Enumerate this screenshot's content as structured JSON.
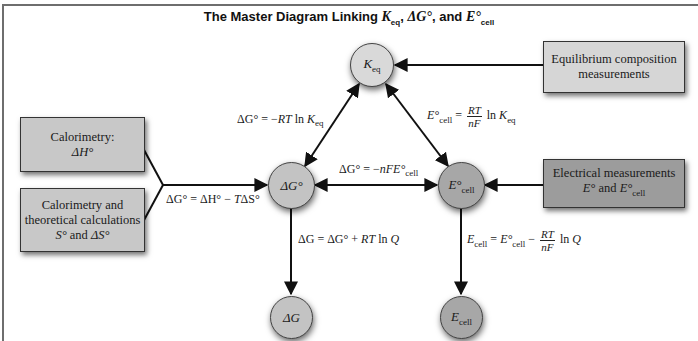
{
  "title": {
    "prefix": "The Master Diagram Linking ",
    "k_symbol": "K",
    "k_sub": "eq",
    "sep1": ", ",
    "dg_symbol": "ΔG°",
    "sep2": ", and ",
    "e_symbol": "E°",
    "e_sub": "cell"
  },
  "nodes": {
    "keq": {
      "symbol": "K",
      "sub": "eq",
      "color": "#d9d9d9"
    },
    "dg0": {
      "symbol": "ΔG°",
      "color": "#c3c3c3"
    },
    "ecell0": {
      "symbol": "E°",
      "sub": "cell",
      "color": "#a7a7a7"
    },
    "dg": {
      "symbol": "ΔG",
      "color": "#c3c3c3"
    },
    "ecell": {
      "symbol": "E",
      "sub": "cell",
      "color": "#a7a7a7"
    }
  },
  "boxes": {
    "equilibrium": {
      "line1": "Equilibrium composition",
      "line2": "measurements",
      "color": "#d6d6d6"
    },
    "electrical": {
      "line1": "Electrical measurements",
      "line2_a": "E°",
      "line2_b": " and ",
      "line2_c": "E°",
      "line2_sub": "cell",
      "color": "#9c9c9c"
    },
    "calorimetry": {
      "line1": "Calorimetry:",
      "line2": "ΔH°",
      "color": "#c8c8c8"
    },
    "theoretical": {
      "line1": "Calorimetry and",
      "line2": "theoretical calculations",
      "line3_a": "S°",
      "line3_b": " and ",
      "line3_c": "ΔS°",
      "color": "#c8c8c8"
    }
  },
  "equations": {
    "dg_keq": {
      "lhs": "ΔG° = −",
      "rt": "RT",
      "ln": " ln ",
      "k": "K",
      "sub": "eq"
    },
    "e_keq": {
      "lhs": "E°",
      "lhs_sub": "cell",
      "eq": " = ",
      "num": "RT",
      "den": "nF",
      "ln": " ln ",
      "k": "K",
      "sub": "eq"
    },
    "dg_e": {
      "lhs": "ΔG° = −",
      "nfe": "nFE°",
      "sub": "cell"
    },
    "dg_h": {
      "text_a": "ΔG° = ΔH° − ",
      "t": "T",
      "text_b": "ΔS°"
    },
    "dg_q": {
      "text_a": "ΔG = ΔG° + ",
      "rt": "RT",
      "ln": " ln ",
      "q": "Q"
    },
    "e_q": {
      "e": "E",
      "sub": "cell",
      "eq": " = ",
      "e0": "E°",
      "sub0": "cell",
      "minus": " − ",
      "num": "RT",
      "den": "nF",
      "ln": " ln ",
      "q": "Q"
    }
  },
  "colors": {
    "frame": "#6e6e6e",
    "arrow": "#111111"
  }
}
